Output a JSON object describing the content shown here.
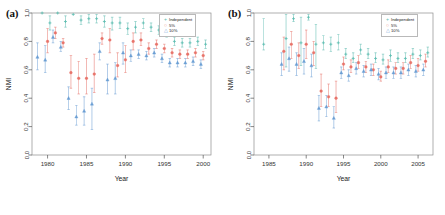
{
  "figure": {
    "panels": [
      {
        "id": "a",
        "label": "(a)",
        "legend_position": "top-right"
      },
      {
        "id": "b",
        "label": "(b)",
        "legend_position": "top-right"
      }
    ]
  },
  "legend": {
    "entries": [
      {
        "label": "Independent",
        "symbol": "+",
        "color": "#5bbcb0"
      },
      {
        "label": "5%",
        "symbol": "○",
        "color": "#e8736a"
      },
      {
        "label": "10%",
        "symbol": "△",
        "color": "#6b9ed4"
      }
    ]
  },
  "chart_data": [
    {
      "type": "scatter",
      "panel": "a",
      "title": "",
      "xlabel": "Year",
      "ylabel": "NMI",
      "xlim": [
        1978,
        2001
      ],
      "ylim": [
        0.0,
        1.0
      ],
      "xticks": [
        1980,
        1985,
        1990,
        1995,
        2000
      ],
      "yticks": [
        0.0,
        0.2,
        0.4,
        0.6,
        0.8,
        1.0
      ],
      "grid": false,
      "errorbars": true,
      "series": [
        {
          "name": "Independent",
          "color": "#5bbcb0",
          "x": [
            1979,
            1980,
            1981,
            1982,
            1983,
            1984,
            1985,
            1986,
            1987,
            1988,
            1989,
            1990,
            1991,
            1992,
            1993,
            1994,
            1995,
            1996,
            1997,
            1998,
            1999,
            2000
          ],
          "values": [
            1.0,
            0.93,
            1.0,
            0.94,
            0.99,
            0.95,
            0.96,
            0.96,
            0.94,
            0.93,
            0.93,
            0.89,
            0.9,
            0.93,
            0.9,
            0.88,
            0.86,
            0.8,
            0.79,
            0.79,
            0.8,
            0.78
          ],
          "err_low": [
            1.0,
            0.88,
            1.0,
            0.9,
            0.99,
            0.92,
            0.93,
            0.93,
            0.9,
            0.88,
            0.89,
            0.85,
            0.86,
            0.89,
            0.87,
            0.85,
            0.83,
            0.77,
            0.76,
            0.76,
            0.77,
            0.75
          ],
          "err_high": [
            1.0,
            0.98,
            1.0,
            0.98,
            0.99,
            0.98,
            0.99,
            0.99,
            0.98,
            0.97,
            0.97,
            0.93,
            0.94,
            0.96,
            0.93,
            0.91,
            0.89,
            0.83,
            0.82,
            0.82,
            0.83,
            0.81
          ]
        },
        {
          "name": "5%",
          "color": "#e8736a",
          "x": [
            1980,
            1981,
            1982,
            1983,
            1984,
            1985,
            1986,
            1987,
            1988,
            1989,
            1990,
            1991,
            1992,
            1993,
            1994,
            1995,
            1996,
            1997,
            1998,
            1999,
            2000
          ],
          "values": [
            0.8,
            0.86,
            0.79,
            0.58,
            0.54,
            0.54,
            0.57,
            0.82,
            0.81,
            0.63,
            0.67,
            0.8,
            0.81,
            0.75,
            0.78,
            0.75,
            0.72,
            0.71,
            0.71,
            0.72,
            0.7
          ],
          "err_low": [
            0.72,
            0.82,
            0.76,
            0.47,
            0.43,
            0.43,
            0.44,
            0.78,
            0.72,
            0.55,
            0.58,
            0.74,
            0.77,
            0.71,
            0.75,
            0.72,
            0.69,
            0.68,
            0.68,
            0.69,
            0.67
          ],
          "err_high": [
            0.89,
            0.9,
            0.82,
            0.7,
            0.66,
            0.68,
            0.71,
            0.86,
            0.89,
            0.72,
            0.77,
            0.86,
            0.86,
            0.79,
            0.81,
            0.78,
            0.75,
            0.74,
            0.74,
            0.75,
            0.73
          ]
        },
        {
          "name": "10%",
          "color": "#6b9ed4",
          "x": [
            1979,
            1980,
            1981,
            1982,
            1983,
            1984,
            1985,
            1986,
            1987,
            1988,
            1989,
            1990,
            1991,
            1992,
            1993,
            1994,
            1995,
            1996,
            1997,
            1998,
            1999,
            2000
          ],
          "values": [
            0.69,
            0.67,
            0.83,
            0.76,
            0.4,
            0.27,
            0.31,
            0.36,
            0.73,
            0.53,
            0.54,
            0.72,
            0.7,
            0.71,
            0.7,
            0.72,
            0.68,
            0.65,
            0.65,
            0.65,
            0.66,
            0.64
          ],
          "err_low": [
            0.6,
            0.58,
            0.79,
            0.73,
            0.32,
            0.21,
            0.21,
            0.18,
            0.67,
            0.43,
            0.43,
            0.64,
            0.66,
            0.68,
            0.67,
            0.69,
            0.65,
            0.62,
            0.62,
            0.62,
            0.63,
            0.61
          ],
          "err_high": [
            0.79,
            0.77,
            0.88,
            0.8,
            0.48,
            0.35,
            0.41,
            0.47,
            0.79,
            0.64,
            0.65,
            0.79,
            0.74,
            0.74,
            0.73,
            0.75,
            0.71,
            0.68,
            0.68,
            0.68,
            0.69,
            0.67
          ]
        }
      ]
    },
    {
      "type": "scatter",
      "panel": "b",
      "title": "",
      "xlabel": "Year",
      "ylabel": "NMI",
      "xlim": [
        1983,
        2007
      ],
      "ylim": [
        0.0,
        1.0
      ],
      "xticks": [
        1985,
        1990,
        1995,
        2000,
        2005
      ],
      "yticks": [
        0.0,
        0.2,
        0.4,
        0.6,
        0.8,
        1.0
      ],
      "grid": false,
      "errorbars": true,
      "series": [
        {
          "name": "Independent",
          "color": "#5bbcb0",
          "x": [
            1984,
            1987,
            1988,
            1989,
            1990,
            1991,
            1992,
            1993,
            1994,
            1995,
            1996,
            1997,
            1998,
            1999,
            2000,
            2001,
            2002,
            2003,
            2004,
            2005,
            2006
          ],
          "values": [
            0.78,
            0.82,
            0.96,
            0.79,
            0.97,
            0.78,
            0.79,
            0.78,
            0.79,
            0.71,
            0.68,
            0.74,
            0.71,
            0.68,
            0.67,
            0.7,
            0.68,
            0.68,
            0.71,
            0.7,
            0.72
          ],
          "err_low": [
            0.74,
            0.62,
            0.94,
            0.63,
            0.95,
            0.61,
            0.74,
            0.73,
            0.74,
            0.68,
            0.65,
            0.71,
            0.68,
            0.65,
            0.64,
            0.66,
            0.65,
            0.65,
            0.68,
            0.67,
            0.69
          ],
          "err_high": [
            0.96,
            0.99,
            0.99,
            0.97,
            0.99,
            0.92,
            0.84,
            0.83,
            0.85,
            0.75,
            0.72,
            0.78,
            0.75,
            0.72,
            0.71,
            0.74,
            0.72,
            0.72,
            0.75,
            0.74,
            0.76
          ]
        },
        {
          "name": "5%",
          "color": "#e8736a",
          "x": [
            1987,
            1988,
            1989,
            1990,
            1991,
            1992,
            1993,
            1994,
            1995,
            1996,
            1997,
            1998,
            1999,
            2000,
            2001,
            2002,
            2003,
            2004,
            2005,
            2006
          ],
          "values": [
            0.73,
            0.78,
            0.7,
            0.78,
            0.72,
            0.45,
            0.41,
            0.4,
            0.64,
            0.62,
            0.65,
            0.62,
            0.6,
            0.55,
            0.62,
            0.61,
            0.61,
            0.65,
            0.63,
            0.66
          ],
          "err_low": [
            0.6,
            0.68,
            0.61,
            0.68,
            0.63,
            0.34,
            0.34,
            0.3,
            0.6,
            0.58,
            0.61,
            0.58,
            0.56,
            0.52,
            0.58,
            0.57,
            0.57,
            0.61,
            0.59,
            0.62
          ],
          "err_high": [
            0.83,
            0.87,
            0.79,
            0.88,
            0.8,
            0.57,
            0.5,
            0.52,
            0.69,
            0.67,
            0.7,
            0.66,
            0.64,
            0.59,
            0.67,
            0.65,
            0.65,
            0.7,
            0.68,
            0.71
          ]
        },
        {
          "name": "10%",
          "color": "#6b9ed4",
          "x": [
            1987,
            1988,
            1989,
            1990,
            1991,
            1992,
            1993,
            1994,
            1995,
            1996,
            1997,
            1998,
            1999,
            2000,
            2001,
            2002,
            2003,
            2004,
            2005,
            2006
          ],
          "values": [
            0.64,
            0.68,
            0.64,
            0.66,
            0.63,
            0.33,
            0.34,
            0.26,
            0.58,
            0.56,
            0.61,
            0.59,
            0.6,
            0.57,
            0.58,
            0.58,
            0.58,
            0.6,
            0.59,
            0.6
          ],
          "err_low": [
            0.56,
            0.59,
            0.56,
            0.57,
            0.55,
            0.24,
            0.27,
            0.19,
            0.54,
            0.52,
            0.57,
            0.55,
            0.56,
            0.53,
            0.54,
            0.54,
            0.54,
            0.56,
            0.55,
            0.56
          ],
          "err_high": [
            0.72,
            0.76,
            0.72,
            0.75,
            0.71,
            0.42,
            0.42,
            0.34,
            0.62,
            0.6,
            0.65,
            0.63,
            0.64,
            0.61,
            0.62,
            0.62,
            0.62,
            0.64,
            0.63,
            0.64
          ]
        }
      ]
    }
  ]
}
